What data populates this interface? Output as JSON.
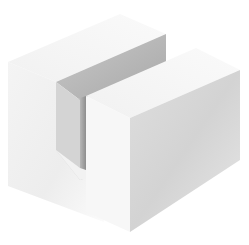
{
  "image": {
    "subject": "isometric cube with slot cut through top (U-shaped block)",
    "background": "#ffffff",
    "shading": {
      "top_face": "#f3f3f3",
      "left_face": "#ebebeb",
      "front_face": "#d9d9d9",
      "slot_wall": "#bdbdbd",
      "slot_shadow": "#8c8c8c",
      "slot_floor": "#f6f6f6"
    }
  }
}
